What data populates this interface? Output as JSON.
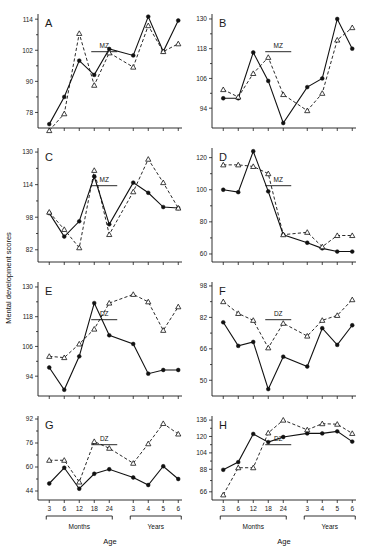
{
  "figure": {
    "ylabel": "Mental development scores",
    "xlabel": "Age",
    "xgroups": [
      {
        "label": "Months",
        "ticks": [
          "3",
          "6",
          "12",
          "18",
          "24"
        ]
      },
      {
        "label": "Years",
        "ticks": [
          "3",
          "4",
          "5",
          "6"
        ]
      }
    ],
    "series_legend": {
      "twin_a": "filled-circle-solid-line",
      "twin_b": "open-triangle-dashed-line"
    }
  },
  "chart_data": [
    {
      "type": "line",
      "panel": "A",
      "zygosity": "MZ",
      "title": "",
      "xlabel": "Age",
      "ylabel": "Mental development scores",
      "categories": [
        "3",
        "6",
        "12",
        "18",
        "24",
        "3",
        "4",
        "5",
        "6"
      ],
      "yticks": [
        78,
        90,
        102,
        114
      ],
      "ylim": [
        72,
        116
      ],
      "series": [
        {
          "name": "twin-1",
          "marker": "filled-circle",
          "line": "solid",
          "values": [
            73.5,
            84.0,
            98.0,
            92.5,
            102.5,
            100.0,
            115.0,
            101.5,
            113.5
          ]
        },
        {
          "name": "twin-2",
          "marker": "open-triangle",
          "line": "dashed",
          "values": [
            71.0,
            77.5,
            108.5,
            88.5,
            101.0,
            95.5,
            111.5,
            101.5,
            104.5
          ]
        }
      ]
    },
    {
      "type": "line",
      "panel": "B",
      "zygosity": "MZ",
      "categories": [
        "3",
        "6",
        "12",
        "18",
        "24",
        "3",
        "4",
        "5",
        "6"
      ],
      "yticks": [
        94,
        106,
        118,
        130
      ],
      "ylim": [
        86,
        132
      ],
      "series": [
        {
          "name": "twin-1",
          "marker": "filled-circle",
          "line": "solid",
          "values": [
            98.0,
            98.0,
            116.5,
            105.0,
            88.0,
            102.5,
            106.0,
            130.0,
            118.0
          ]
        },
        {
          "name": "twin-2",
          "marker": "open-triangle",
          "line": "dashed",
          "values": [
            101.5,
            98.5,
            108.0,
            114.5,
            99.5,
            93.0,
            100.0,
            121.5,
            126.5
          ]
        }
      ]
    },
    {
      "type": "line",
      "panel": "C",
      "zygosity": "MZ",
      "categories": [
        "3",
        "6",
        "12",
        "18",
        "24",
        "3",
        "4",
        "5",
        "6"
      ],
      "yticks": [
        82,
        98,
        114,
        130
      ],
      "ylim": [
        76,
        132
      ],
      "series": [
        {
          "name": "twin-1",
          "marker": "filled-circle",
          "line": "solid",
          "values": [
            100.0,
            88.5,
            96.0,
            118.0,
            94.5,
            115.0,
            110.0,
            103.0,
            102.5
          ]
        },
        {
          "name": "twin-2",
          "marker": "open-triangle",
          "line": "dashed",
          "values": [
            100.5,
            92.0,
            83.0,
            121.0,
            89.5,
            110.5,
            126.5,
            115.0,
            102.5
          ]
        }
      ]
    },
    {
      "type": "line",
      "panel": "D",
      "zygosity": "MZ",
      "categories": [
        "3",
        "6",
        "12",
        "18",
        "24",
        "3",
        "4",
        "5",
        "6"
      ],
      "yticks": [
        60,
        80,
        100,
        120
      ],
      "ylim": [
        55,
        126
      ],
      "series": [
        {
          "name": "twin-1",
          "marker": "filled-circle",
          "line": "solid",
          "values": [
            100.0,
            98.5,
            124.0,
            99.0,
            72.0,
            67.0,
            63.5,
            61.5,
            61.5
          ]
        },
        {
          "name": "twin-2",
          "marker": "open-triangle",
          "line": "dashed",
          "values": [
            115.5,
            115.5,
            114.5,
            110.0,
            72.0,
            73.5,
            64.5,
            71.5,
            71.5
          ]
        }
      ]
    },
    {
      "type": "line",
      "panel": "E",
      "zygosity": "DZ",
      "categories": [
        "3",
        "6",
        "12",
        "18",
        "24",
        "3",
        "4",
        "5",
        "6"
      ],
      "yticks": [
        94,
        106,
        118,
        130
      ],
      "ylim": [
        86,
        132
      ],
      "series": [
        {
          "name": "twin-1",
          "marker": "filled-circle",
          "line": "solid",
          "values": [
            97.5,
            88.5,
            102.0,
            123.5,
            110.5,
            107.0,
            95.0,
            96.5,
            96.5
          ]
        },
        {
          "name": "twin-2",
          "marker": "open-triangle",
          "line": "dashed",
          "values": [
            102.0,
            101.5,
            107.0,
            113.0,
            123.5,
            127.0,
            124.0,
            112.5,
            122.0
          ]
        }
      ]
    },
    {
      "type": "line",
      "panel": "F",
      "zygosity": "DZ",
      "categories": [
        "3",
        "6",
        "12",
        "18",
        "24",
        "3",
        "4",
        "5",
        "6"
      ],
      "yticks": [
        50,
        66,
        82,
        98
      ],
      "ylim": [
        42,
        100
      ],
      "series": [
        {
          "name": "twin-1",
          "marker": "filled-circle",
          "line": "solid",
          "values": [
            79.5,
            67.5,
            69.5,
            45.5,
            62.0,
            57.0,
            76.5,
            68.0,
            78.0
          ]
        },
        {
          "name": "twin-2",
          "marker": "open-triangle",
          "line": "dashed",
          "values": [
            90.0,
            84.0,
            80.5,
            66.5,
            79.0,
            72.5,
            80.5,
            83.0,
            91.0
          ]
        }
      ]
    },
    {
      "type": "line",
      "panel": "G",
      "zygosity": "DZ",
      "categories": [
        "3",
        "6",
        "12",
        "18",
        "24",
        "3",
        "4",
        "5",
        "6"
      ],
      "yticks": [
        44,
        60,
        76,
        92
      ],
      "ylim": [
        38,
        94
      ],
      "series": [
        {
          "name": "twin-1",
          "marker": "filled-circle",
          "line": "solid",
          "values": [
            49.0,
            59.5,
            45.5,
            55.5,
            58.5,
            53.0,
            48.0,
            60.5,
            52.0
          ]
        },
        {
          "name": "twin-2",
          "marker": "open-triangle",
          "line": "dashed",
          "values": [
            64.5,
            64.5,
            50.0,
            77.0,
            72.5,
            62.5,
            75.5,
            89.0,
            82.0
          ]
        }
      ]
    },
    {
      "type": "line",
      "panel": "H",
      "zygosity": "DZ",
      "categories": [
        "3",
        "6",
        "12",
        "18",
        "24",
        "3",
        "4",
        "5",
        "6"
      ],
      "yticks": [
        66,
        88,
        104,
        120,
        136
      ],
      "ylim": [
        58,
        140
      ],
      "series": [
        {
          "name": "twin-1",
          "marker": "filled-circle",
          "line": "solid",
          "values": [
            87.5,
            95.0,
            122.5,
            114.5,
            119.5,
            123.0,
            123.0,
            125.0,
            115.0
          ]
        },
        {
          "name": "twin-2",
          "marker": "open-triangle",
          "line": "dashed",
          "values": [
            63.0,
            89.5,
            89.5,
            123.5,
            136.0,
            126.5,
            132.5,
            132.0,
            123.0
          ]
        }
      ]
    }
  ]
}
